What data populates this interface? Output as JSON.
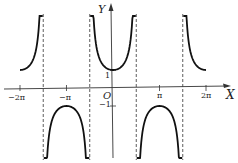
{
  "chart_data": {
    "type": "line",
    "title": "",
    "function": "y = sec x",
    "xlabel": "X",
    "ylabel": "Y",
    "origin_label": "O",
    "x_ticks": [
      {
        "value": -6.2832,
        "label": "−2π"
      },
      {
        "value": -3.1416,
        "label": "−π"
      },
      {
        "value": 3.1416,
        "label": "π"
      },
      {
        "value": 6.2832,
        "label": "2π"
      }
    ],
    "y_ticks": [
      {
        "value": 1,
        "label": "1"
      },
      {
        "value": -1,
        "label": "−1"
      }
    ],
    "asymptotes": [
      -4.7124,
      -1.5708,
      1.5708,
      4.7124
    ],
    "xlim": [
      -6.4,
      6.4
    ],
    "ylim": [
      -4.0,
      4.2
    ],
    "grid": false,
    "legend": null,
    "series": [
      {
        "name": "sec x",
        "domain": [
          -6.28,
          -4.75
        ]
      },
      {
        "name": "sec x",
        "domain": [
          -4.68,
          -1.6
        ]
      },
      {
        "name": "sec x",
        "domain": [
          -1.54,
          1.54
        ]
      },
      {
        "name": "sec x",
        "domain": [
          1.6,
          4.68
        ]
      },
      {
        "name": "sec x",
        "domain": [
          4.75,
          6.28
        ]
      }
    ]
  },
  "labels": {
    "x_axis": "X",
    "y_axis": "Y",
    "origin": "O",
    "tick_neg2pi": "−2π",
    "tick_negpi": "−π",
    "tick_pi": "π",
    "tick_2pi": "2π",
    "tick_one": "1",
    "tick_negone": "−1"
  }
}
